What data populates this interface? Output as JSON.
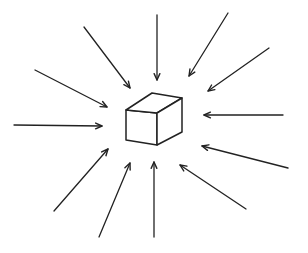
{
  "diagram": {
    "width": 308,
    "height": 253,
    "stroke_color": "#222222",
    "background": "#ffffff",
    "cube": {
      "front_face": [
        [
          126,
          110
        ],
        [
          157,
          113
        ],
        [
          157,
          145
        ],
        [
          126,
          140
        ]
      ],
      "top_face": [
        [
          126,
          110
        ],
        [
          152,
          93
        ],
        [
          182,
          98
        ],
        [
          157,
          113
        ]
      ],
      "side_face": [
        [
          157,
          113
        ],
        [
          182,
          98
        ],
        [
          182,
          132
        ],
        [
          157,
          145
        ]
      ]
    },
    "arrows": [
      {
        "id": "top",
        "from": [
          157,
          15
        ],
        "to": [
          157,
          80
        ]
      },
      {
        "id": "top-right-steep",
        "from": [
          228,
          13
        ],
        "to": [
          189,
          76
        ]
      },
      {
        "id": "top-right",
        "from": [
          269,
          48
        ],
        "to": [
          208,
          91
        ]
      },
      {
        "id": "right",
        "from": [
          283,
          115
        ],
        "to": [
          204,
          115
        ]
      },
      {
        "id": "bottom-right",
        "from": [
          288,
          168
        ],
        "to": [
          202,
          146
        ]
      },
      {
        "id": "bottom-right-steep",
        "from": [
          246,
          209
        ],
        "to": [
          180,
          165
        ]
      },
      {
        "id": "bottom",
        "from": [
          154,
          237
        ],
        "to": [
          154,
          162
        ]
      },
      {
        "id": "bottom-left-steep",
        "from": [
          99,
          237
        ],
        "to": [
          130,
          163
        ]
      },
      {
        "id": "bottom-left",
        "from": [
          54,
          211
        ],
        "to": [
          108,
          149
        ]
      },
      {
        "id": "left",
        "from": [
          14,
          125
        ],
        "to": [
          102,
          126
        ]
      },
      {
        "id": "top-left",
        "from": [
          35,
          70
        ],
        "to": [
          107,
          107
        ]
      },
      {
        "id": "top-left-steep",
        "from": [
          84,
          27
        ],
        "to": [
          130,
          88
        ]
      }
    ]
  }
}
